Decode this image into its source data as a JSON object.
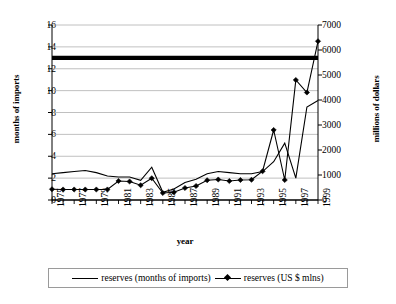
{
  "chart_data": {
    "type": "line",
    "title": "",
    "xlabel": "year",
    "ylabel_left": "months of imports",
    "ylabel_right": "millions of dollars",
    "grid": true,
    "legend_position": "bottom",
    "x": [
      1975,
      1976,
      1977,
      1978,
      1979,
      1980,
      1981,
      1982,
      1983,
      1984,
      1985,
      1986,
      1987,
      1988,
      1989,
      1990,
      1991,
      1992,
      1993,
      1994,
      1995,
      1996,
      1997,
      1998,
      1999
    ],
    "xtick_labels": [
      "1975",
      "1977",
      "1979",
      "1981",
      "1983",
      "1985",
      "1987",
      "1989",
      "1991",
      "1993",
      "1995",
      "1997",
      "1999"
    ],
    "left_axis": {
      "min": 0,
      "max": 16,
      "step": 2,
      "ticks": [
        "0",
        "2",
        "4",
        "6",
        "8",
        "10",
        "12",
        "14",
        "16"
      ]
    },
    "right_axis": {
      "min": 0,
      "max": 7000,
      "step": 1000,
      "ticks": [
        "0",
        "1000",
        "2000",
        "3000",
        "4000",
        "5000",
        "6000",
        "7000"
      ]
    },
    "series": [
      {
        "name": "reserves (months of imports)",
        "axis": "left",
        "style": "thick-line",
        "marker": "none",
        "color": "#000000",
        "values": [
          13,
          13,
          13,
          13,
          13,
          13,
          13,
          13,
          13,
          13,
          13,
          13,
          13,
          13,
          13,
          13,
          13,
          13,
          13,
          13,
          13,
          13,
          13,
          13,
          13
        ]
      },
      {
        "name": "reserves-secondary-thin",
        "axis": "left",
        "style": "thin-line",
        "marker": "none",
        "color": "#000000",
        "values": [
          2.4,
          2.5,
          2.6,
          2.7,
          2.5,
          2.2,
          2.1,
          2.1,
          1.8,
          3.0,
          0.7,
          1.0,
          1.6,
          1.9,
          2.4,
          2.6,
          2.5,
          2.4,
          2.4,
          2.6,
          3.5,
          5.2,
          2.0,
          8.5,
          9.1
        ]
      },
      {
        "name": "reserves (US $ mlns)",
        "axis": "right",
        "style": "thin-line",
        "marker": "diamond",
        "color": "#000000",
        "values": [
          430,
          420,
          420,
          420,
          420,
          420,
          760,
          740,
          590,
          870,
          280,
          310,
          480,
          560,
          790,
          820,
          760,
          800,
          810,
          1150,
          2800,
          800,
          4800,
          4300,
          6350
        ]
      }
    ]
  }
}
